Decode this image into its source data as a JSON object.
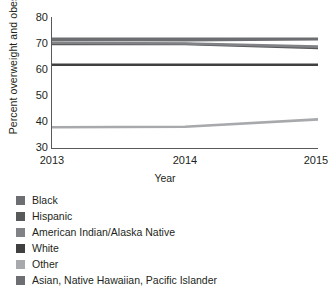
{
  "chart_data": {
    "type": "line",
    "title": "",
    "xlabel": "Year",
    "ylabel": "Percent overweight and obese",
    "categories": [
      "2013",
      "2014",
      "2015"
    ],
    "x": [
      2013,
      2014,
      2015
    ],
    "xlim": [
      2013,
      2015
    ],
    "ylim": [
      30,
      80
    ],
    "yticks": [
      30,
      40,
      50,
      60,
      70,
      80
    ],
    "grid": false,
    "legend_position": "below",
    "series": [
      {
        "name": "Black",
        "values": [
          72.0,
          72.0,
          72.0
        ],
        "color": "#6d6e71"
      },
      {
        "name": "Hispanic",
        "values": [
          70.0,
          70.0,
          68.5
        ],
        "color": "#58595b"
      },
      {
        "name": "American Indian/Alaska Native",
        "values": [
          70.5,
          70.2,
          69.0
        ],
        "color": "#808285"
      },
      {
        "name": "White",
        "values": [
          62.0,
          62.0,
          62.0
        ],
        "color": "#404041"
      },
      {
        "name": "Other",
        "values": [
          38.0,
          38.2,
          41.0
        ],
        "color": "#a7a9ac"
      },
      {
        "name": "Asian, Native Hawaiian, Pacific Islander",
        "values": [
          71.6,
          71.5,
          71.8
        ],
        "color": "#6d6e71"
      }
    ]
  },
  "legend": {
    "items": [
      {
        "label": "Black",
        "color": "#6d6e71"
      },
      {
        "label": "Hispanic",
        "color": "#58595b"
      },
      {
        "label": "American Indian/Alaska Native",
        "color": "#808285"
      },
      {
        "label": "White",
        "color": "#404041"
      },
      {
        "label": "Other",
        "color": "#a7a9ac"
      },
      {
        "label": "Asian, Native Hawaiian, Pacific Islander",
        "color": "#6d6e71"
      }
    ]
  }
}
